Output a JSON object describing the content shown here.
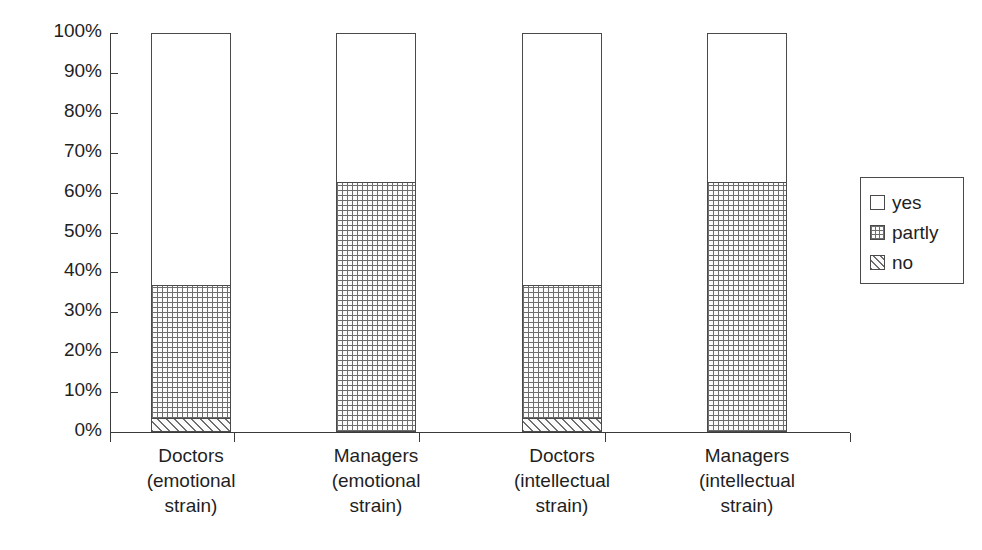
{
  "chart_data": {
    "type": "bar",
    "subtype": "stacked-100-percent",
    "title": "",
    "xlabel": "",
    "ylabel": "",
    "ylim": [
      0,
      100
    ],
    "y_tick_labels": [
      "100%",
      "90%",
      "80%",
      "70%",
      "60%",
      "50%",
      "40%",
      "30%",
      "20%",
      "10%",
      "0%"
    ],
    "y_tick_values": [
      100,
      90,
      80,
      70,
      60,
      50,
      40,
      30,
      20,
      10,
      0
    ],
    "grid": false,
    "legend_position": "right",
    "categories": [
      "Doctors (emotional strain)",
      "Managers (emotional strain)",
      "Doctors (intellectual strain)",
      "Managers (intellectual strain)"
    ],
    "category_label_lines": [
      [
        "Doctors",
        "(emotional",
        "strain)"
      ],
      [
        "Managers",
        "(emotional",
        "strain)"
      ],
      [
        "Doctors",
        "(intellectual",
        "strain)"
      ],
      [
        "Managers",
        "(intellectual",
        "strain)"
      ]
    ],
    "series": [
      {
        "name": "yes",
        "pattern": "empty",
        "values": [
          63.4,
          37.5,
          63.4,
          37.5
        ]
      },
      {
        "name": "partly",
        "pattern": "grid-dots",
        "values": [
          33.4,
          62.5,
          33.4,
          62.5
        ]
      },
      {
        "name": "no",
        "pattern": "diagonal-hatch",
        "values": [
          3.2,
          0.0,
          3.2,
          0.0
        ]
      }
    ],
    "stack_boundaries_percent": [
      {
        "category": "Doctors (emotional strain)",
        "no_top": 3.2,
        "partly_top": 36.6
      },
      {
        "category": "Managers (emotional strain)",
        "no_top": 0.0,
        "partly_top": 62.5
      },
      {
        "category": "Doctors (intellectual strain)",
        "no_top": 3.2,
        "partly_top": 36.6
      },
      {
        "category": "Managers (intellectual strain)",
        "no_top": 0.0,
        "partly_top": 62.5
      }
    ]
  },
  "legend": {
    "items": [
      {
        "label": "yes",
        "swatch": "swatch-empty-icon"
      },
      {
        "label": "partly",
        "swatch": "swatch-grid-icon"
      },
      {
        "label": "no",
        "swatch": "swatch-hatch-icon"
      }
    ]
  },
  "colors": {
    "axis": "#3a3a3a",
    "bar_outline": "#4a4a4a",
    "pattern_ink": "#6e6e6e",
    "background": "#ffffff",
    "text": "#1f1f1f"
  }
}
